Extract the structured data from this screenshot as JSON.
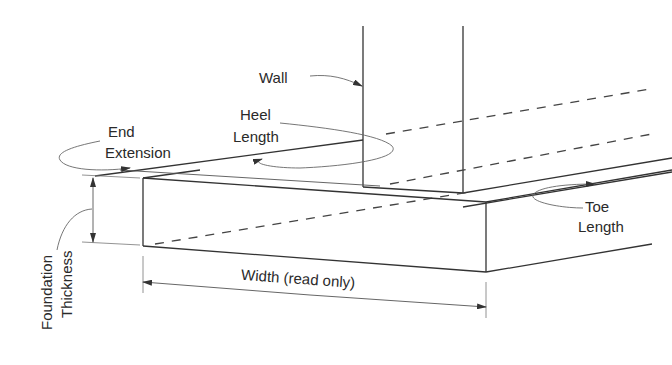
{
  "diagram": {
    "labels": {
      "wall": "Wall",
      "heel_line1": "Heel",
      "heel_line2": "Length",
      "end_line1": "End",
      "end_line2": "Extension",
      "toe_line1": "Toe",
      "toe_line2": "Length",
      "thickness_line1": "Foundation",
      "thickness_line2": "Thickness",
      "width": "Width (read only)"
    },
    "colors": {
      "background": "#ffffff",
      "line": "#333333",
      "text": "#2a2a2a"
    }
  }
}
